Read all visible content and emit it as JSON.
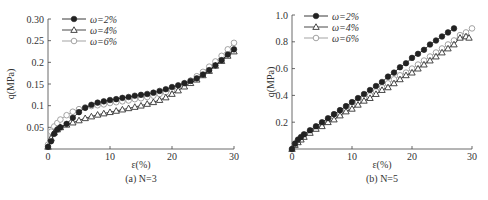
{
  "chart_data": [
    {
      "type": "line",
      "caption": "(a) N=3",
      "xlabel": "ε(%)",
      "ylabel": "q(MPa)",
      "xlim": [
        0,
        30
      ],
      "ylim": [
        0,
        0.3
      ],
      "xticks": [
        0,
        10,
        20,
        30
      ],
      "xtick_labels": [
        "0",
        "10",
        "20",
        "30"
      ],
      "yticks": [
        0.05,
        0.1,
        0.15,
        0.2,
        0.25,
        0.3
      ],
      "ytick_labels": [
        "0.05",
        "0.1",
        "0.15",
        "0.2",
        "0.25",
        "0.30"
      ],
      "legend_position": "upper left",
      "grid": false,
      "series": [
        {
          "name": "ω=2%",
          "marker": "filled-circle",
          "color": "#222222",
          "x": [
            0,
            0.5,
            1,
            1.5,
            2,
            3,
            4,
            5,
            6,
            7,
            8,
            9,
            10,
            11,
            12,
            13,
            14,
            15,
            16,
            17,
            18,
            19,
            20,
            21,
            22,
            23,
            24,
            25,
            26,
            27,
            28,
            29,
            30
          ],
          "y": [
            0.005,
            0.018,
            0.035,
            0.045,
            0.05,
            0.058,
            0.072,
            0.085,
            0.095,
            0.102,
            0.107,
            0.11,
            0.113,
            0.115,
            0.118,
            0.12,
            0.123,
            0.125,
            0.127,
            0.13,
            0.134,
            0.138,
            0.143,
            0.147,
            0.152,
            0.157,
            0.163,
            0.172,
            0.182,
            0.193,
            0.205,
            0.218,
            0.23
          ]
        },
        {
          "name": "ω=4%",
          "marker": "open-triangle",
          "color": "#333333",
          "x": [
            0,
            0.5,
            1,
            1.5,
            2,
            3,
            4,
            5,
            6,
            7,
            8,
            9,
            10,
            11,
            12,
            13,
            14,
            15,
            16,
            17,
            18,
            19,
            20,
            21,
            22,
            23,
            24,
            25,
            26,
            27,
            28,
            29,
            30
          ],
          "y": [
            0.005,
            0.025,
            0.038,
            0.045,
            0.05,
            0.056,
            0.061,
            0.066,
            0.071,
            0.075,
            0.079,
            0.082,
            0.085,
            0.088,
            0.091,
            0.094,
            0.097,
            0.1,
            0.104,
            0.108,
            0.113,
            0.119,
            0.127,
            0.135,
            0.144,
            0.152,
            0.16,
            0.17,
            0.18,
            0.192,
            0.203,
            0.215,
            0.225
          ]
        },
        {
          "name": "ω=6%",
          "marker": "open-circle",
          "color": "#999999",
          "x": [
            0,
            0.5,
            1,
            1.5,
            2,
            3,
            4,
            5,
            6,
            7,
            8,
            9,
            10,
            11,
            12,
            13,
            14,
            15,
            16,
            17,
            18,
            19,
            20,
            21,
            22,
            23,
            24,
            25,
            26,
            27,
            28,
            29,
            30
          ],
          "y": [
            0.01,
            0.04,
            0.052,
            0.06,
            0.068,
            0.078,
            0.086,
            0.092,
            0.096,
            0.099,
            0.101,
            0.103,
            0.106,
            0.108,
            0.11,
            0.112,
            0.115,
            0.117,
            0.12,
            0.123,
            0.127,
            0.131,
            0.136,
            0.142,
            0.149,
            0.158,
            0.168,
            0.178,
            0.19,
            0.202,
            0.215,
            0.23,
            0.245
          ]
        }
      ]
    },
    {
      "type": "line",
      "caption": "(b) N=5",
      "xlabel": "ε(%)",
      "ylabel": "q(MPa)",
      "xlim": [
        0,
        30
      ],
      "ylim": [
        0,
        1.0
      ],
      "xticks": [
        0,
        10,
        20,
        30
      ],
      "xtick_labels": [
        "0",
        "10",
        "20",
        "30"
      ],
      "yticks": [
        0.2,
        0.4,
        0.6,
        0.8,
        1.0
      ],
      "ytick_labels": [
        "0.2",
        "0.4",
        "0.6",
        "0.8",
        "1.0"
      ],
      "legend_position": "upper left",
      "grid": false,
      "series": [
        {
          "name": "ω=2%",
          "marker": "filled-circle",
          "color": "#222222",
          "x": [
            0,
            0.5,
            1,
            1.5,
            2,
            3,
            4,
            5,
            6,
            7,
            8,
            9,
            10,
            11,
            12,
            13,
            14,
            15,
            16,
            17,
            18,
            19,
            20,
            21,
            22,
            23,
            24,
            25,
            26,
            27
          ],
          "y": [
            0.0,
            0.04,
            0.07,
            0.09,
            0.11,
            0.14,
            0.17,
            0.2,
            0.23,
            0.26,
            0.29,
            0.32,
            0.35,
            0.38,
            0.41,
            0.44,
            0.47,
            0.5,
            0.54,
            0.57,
            0.61,
            0.64,
            0.68,
            0.71,
            0.74,
            0.78,
            0.81,
            0.84,
            0.87,
            0.9
          ]
        },
        {
          "name": "ω=4%",
          "marker": "open-triangle",
          "color": "#333333",
          "x": [
            0,
            0.5,
            1,
            1.5,
            2,
            3,
            4,
            5,
            6,
            7,
            8,
            9,
            10,
            11,
            12,
            13,
            14,
            15,
            16,
            17,
            18,
            19,
            20,
            21,
            22,
            23,
            24,
            25,
            26,
            27,
            28,
            29,
            29.5
          ],
          "y": [
            0.0,
            0.03,
            0.05,
            0.07,
            0.09,
            0.12,
            0.15,
            0.17,
            0.2,
            0.22,
            0.25,
            0.28,
            0.3,
            0.33,
            0.36,
            0.38,
            0.41,
            0.44,
            0.46,
            0.49,
            0.52,
            0.55,
            0.57,
            0.6,
            0.63,
            0.66,
            0.69,
            0.72,
            0.75,
            0.78,
            0.83,
            0.84,
            0.83
          ]
        },
        {
          "name": "ω=6%",
          "marker": "open-circle",
          "color": "#999999",
          "x": [
            0,
            0.5,
            1,
            1.5,
            2,
            3,
            4,
            5,
            6,
            7,
            8,
            9,
            10,
            11,
            12,
            13,
            14,
            15,
            16,
            17,
            18,
            19,
            20,
            21,
            22,
            23,
            24,
            25,
            26,
            27,
            28,
            29,
            30
          ],
          "y": [
            0.0,
            0.04,
            0.06,
            0.08,
            0.1,
            0.13,
            0.16,
            0.18,
            0.21,
            0.24,
            0.26,
            0.29,
            0.32,
            0.35,
            0.38,
            0.4,
            0.43,
            0.46,
            0.49,
            0.52,
            0.55,
            0.57,
            0.6,
            0.63,
            0.66,
            0.69,
            0.72,
            0.75,
            0.78,
            0.81,
            0.85,
            0.87,
            0.9
          ]
        }
      ]
    }
  ],
  "layout": {
    "panels": [
      {
        "x0": 48,
        "x1": 234,
        "y0": 149,
        "y1": 19
      },
      {
        "x0": 292,
        "x1": 472,
        "y0": 149,
        "y1": 15
      }
    ]
  }
}
